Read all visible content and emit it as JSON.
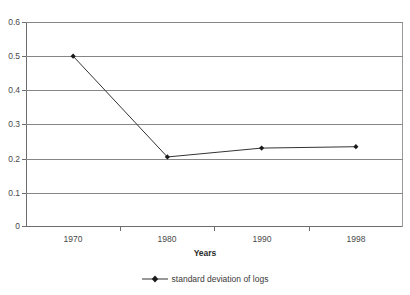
{
  "chart_data": {
    "type": "line",
    "title": "",
    "xlabel": "Years",
    "ylabel": "",
    "categories": [
      "1970",
      "1980",
      "1990",
      "1998"
    ],
    "series": [
      {
        "name": "standard deviation of logs",
        "values": [
          0.5,
          0.205,
          0.231,
          0.235
        ]
      }
    ],
    "ylim": [
      0,
      0.6
    ],
    "yticks": [
      "0",
      "0.1",
      "0.2",
      "0.3",
      "0.4",
      "0.5",
      "0.6"
    ],
    "ytick_values": [
      0,
      0.1,
      0.2,
      0.3,
      0.4,
      0.5,
      0.6
    ],
    "grid": true,
    "legend_position": "bottom",
    "colors": {
      "series_line": "#333333",
      "marker": "#1a1a1a",
      "gridline": "#868686",
      "axis": "#6d6d6d",
      "text": "#4a4a4a",
      "background": "#ffffff"
    }
  },
  "axis": {
    "x_title": "Years",
    "x_tick_labels": [
      "1970",
      "1980",
      "1990",
      "1998"
    ],
    "y_tick_labels": [
      "0.6",
      "0.5",
      "0.4",
      "0.3",
      "0.2",
      "0.1",
      "0"
    ]
  },
  "legend": {
    "entries": [
      {
        "label": "standard deviation of logs",
        "marker": "diamond-line-marker"
      }
    ]
  },
  "title_fragment": ""
}
